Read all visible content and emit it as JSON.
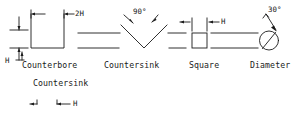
{
  "figure": {
    "type": "engineering-drawing-symbol-reference",
    "line_color": "#1a1a1a",
    "background_color": "#ffffff"
  },
  "symbols": [
    {
      "id": "counterbore",
      "label": "Counterbore",
      "secondary_label": "Countersink",
      "width_dim": "2H",
      "height_dim": "H",
      "left_dim": "H"
    },
    {
      "id": "countersink",
      "label": "Countersink",
      "angle": "90°"
    },
    {
      "id": "square",
      "label": "Square",
      "width_dim": "H"
    },
    {
      "id": "diameter",
      "label": "Diameter",
      "angle": "30°"
    }
  ],
  "annotations": {
    "counterbore_width": "2H",
    "counterbore_height": "H",
    "counterbore_left": "H",
    "countersink_angle": "90°",
    "square_width": "H",
    "diameter_slash_angle": "30°",
    "partial_bottom_dim": "H"
  },
  "labels": {
    "counterbore": "Counterbore",
    "countersink": "Countersink",
    "countersink_row2": "Countersink",
    "square": "Square",
    "diameter": "Diameter"
  }
}
